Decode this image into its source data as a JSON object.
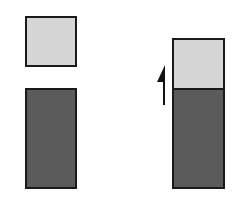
{
  "colors": {
    "light_block": "#d6d6d6",
    "dark_block": "#5b5b5b",
    "border": "#1a1a1a",
    "arrow": "#111111",
    "background": "#ffffff"
  },
  "diagram": {
    "left_group": {
      "top_block": {
        "shade": "light",
        "x": 25,
        "y": 16,
        "w": 52,
        "h": 50
      },
      "bottom_block": {
        "shade": "dark",
        "x": 25,
        "y": 88,
        "w": 52,
        "h": 100
      }
    },
    "right_group": {
      "stack": [
        {
          "shade": "light",
          "x": 172,
          "y": 38,
          "w": 52,
          "h": 51
        },
        {
          "shade": "dark",
          "x": 172,
          "y": 88,
          "w": 52,
          "h": 100
        }
      ],
      "arrow": {
        "direction": "up",
        "style": "half-head",
        "x": 164,
        "y_from": 105,
        "y_to": 66
      }
    }
  }
}
